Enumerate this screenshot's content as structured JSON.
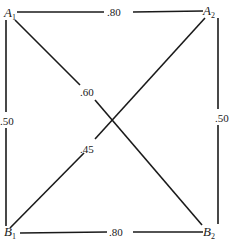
{
  "nodes": {
    "A1": {
      "letter": "A",
      "sub": "1"
    },
    "A2": {
      "letter": "A",
      "sub": "2"
    },
    "B1": {
      "letter": "B",
      "sub": "1"
    },
    "B2": {
      "letter": "B",
      "sub": "2"
    }
  },
  "edges": {
    "A1_A2": {
      "from": "A1",
      "to": "A2",
      "weight": ".80"
    },
    "B1_B2": {
      "from": "B1",
      "to": "B2",
      "weight": ".80"
    },
    "A1_B1": {
      "from": "A1",
      "to": "B1",
      "weight": ".50"
    },
    "A2_B2": {
      "from": "A2",
      "to": "B2",
      "weight": ".50"
    },
    "A1_B2": {
      "from": "A1",
      "to": "B2",
      "weight": ".60"
    },
    "A2_B1": {
      "from": "A2",
      "to": "B1",
      "weight": ".45"
    }
  },
  "colors": {
    "line": "#1a1a1a",
    "background": "#ffffff"
  }
}
